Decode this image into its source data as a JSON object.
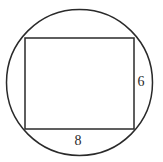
{
  "diagram": {
    "shapes": {
      "circle": {
        "cx": 79.5,
        "cy": 82.5,
        "r": 73
      },
      "rectangle": {
        "x": 25,
        "y": 38,
        "width": 109,
        "height": 91
      }
    },
    "labels": {
      "bottom_side": "8",
      "right_side": "6"
    },
    "colors": {
      "stroke": "#2a2a2a",
      "background": "#ffffff"
    }
  }
}
